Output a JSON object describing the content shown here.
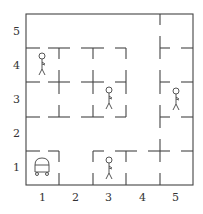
{
  "diagram": {
    "type": "gridworld",
    "x_ticks": [
      "1",
      "2",
      "3",
      "4",
      "5"
    ],
    "y_ticks": [
      "1",
      "2",
      "3",
      "4",
      "5"
    ],
    "robot": {
      "x": 1,
      "y": 1,
      "icon": "robot-icon"
    },
    "people": [
      {
        "x": 1,
        "y": 4,
        "icon": "person-icon"
      },
      {
        "x": 3,
        "y": 3,
        "icon": "person-icon"
      },
      {
        "x": 5,
        "y": 3,
        "icon": "person-icon"
      },
      {
        "x": 3,
        "y": 1,
        "icon": "person-icon"
      }
    ]
  }
}
